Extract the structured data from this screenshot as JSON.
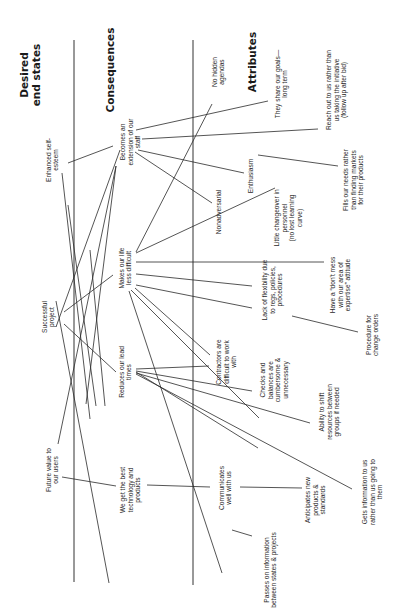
{
  "diagram": {
    "type": "hierarchical value map",
    "orientation": "rotated-90-ccw",
    "columns": [
      {
        "id": "desired",
        "lines": [
          "Desired",
          "end states"
        ],
        "x": 30,
        "y": 75
      },
      {
        "id": "consequences",
        "lines": [
          "Consequences"
        ],
        "x": 110,
        "y": 70
      },
      {
        "id": "attributes",
        "lines": [
          "Attributes"
        ],
        "x": 252,
        "y": 62
      }
    ],
    "nodes": [
      {
        "id": "self_esteem",
        "lines": [
          "Enhanced self-",
          "esteem"
        ],
        "x": 52,
        "y": 160
      },
      {
        "id": "successful_project",
        "lines": [
          "Successful",
          "project"
        ],
        "x": 48,
        "y": 317
      },
      {
        "id": "future_value",
        "lines": [
          "Future value to",
          "our users"
        ],
        "x": 52,
        "y": 470
      },
      {
        "id": "extension_staff",
        "lines": [
          "Becomes an",
          "extension of our",
          "staff"
        ],
        "x": 130,
        "y": 142
      },
      {
        "id": "life_less_difficult",
        "lines": [
          "Makes our life",
          "less difficult"
        ],
        "x": 125,
        "y": 268
      },
      {
        "id": "lead_times",
        "lines": [
          "Reduces our lead",
          "times"
        ],
        "x": 125,
        "y": 372
      },
      {
        "id": "best_technology",
        "lines": [
          "We get the best",
          "technology and",
          "products"
        ],
        "x": 130,
        "y": 490
      },
      {
        "id": "no_hidden",
        "lines": [
          "No hidden",
          "agendas"
        ],
        "x": 218,
        "y": 72
      },
      {
        "id": "nonadversarial",
        "lines": [
          "Nonadversarial"
        ],
        "x": 218,
        "y": 212
      },
      {
        "id": "contractors_difficult",
        "lines": [
          "Contractors are",
          "difficult to work",
          "with"
        ],
        "x": 226,
        "y": 362
      },
      {
        "id": "communicates",
        "lines": [
          "Communicates",
          "well with us"
        ],
        "x": 225,
        "y": 488
      },
      {
        "id": "share_goals",
        "lines": [
          "They share our goals—",
          "long term"
        ],
        "x": 281,
        "y": 84
      },
      {
        "id": "enthusiasm",
        "lines": [
          "Enthusiasm"
        ],
        "x": 250,
        "y": 176
      },
      {
        "id": "little_changeover",
        "lines": [
          "Little changeover in",
          "personnel",
          "(no lost learning",
          "curve)"
        ],
        "x": 288,
        "y": 218
      },
      {
        "id": "lack_flexibility",
        "lines": [
          "Lack of flexibility due",
          "to regs, policies,",
          "procedures"
        ],
        "x": 272,
        "y": 290
      },
      {
        "id": "checks_balances",
        "lines": [
          "Checks and",
          "balances are",
          "cumbersome &",
          "unnecessary"
        ],
        "x": 274,
        "y": 380
      },
      {
        "id": "passes_info",
        "lines": [
          "Passes on information",
          "between states & projects"
        ],
        "x": 270,
        "y": 570
      },
      {
        "id": "reach_out",
        "lines": [
          "Reach out to us rather than",
          "us taking the initiative",
          "(follow up after bid)"
        ],
        "x": 336,
        "y": 90
      },
      {
        "id": "fills_needs",
        "lines": [
          "Fills our needs rather",
          "than finding markets",
          "for their products"
        ],
        "x": 353,
        "y": 180
      },
      {
        "id": "dont_mess",
        "lines": [
          "Have a “don't mess",
          "with our area of",
          "expertise” attitude"
        ],
        "x": 340,
        "y": 285
      },
      {
        "id": "change_orders",
        "lines": [
          "Procedure for",
          "change orders"
        ],
        "x": 372,
        "y": 335
      },
      {
        "id": "shift_resources",
        "lines": [
          "Ability to shift",
          "resources between",
          "groups if needed"
        ],
        "x": 329,
        "y": 412
      },
      {
        "id": "anticipates",
        "lines": [
          "Anticipates new",
          "products &",
          "standards"
        ],
        "x": 315,
        "y": 500
      },
      {
        "id": "gets_info",
        "lines": [
          "Gets information to us",
          "rather than us going to",
          "them"
        ],
        "x": 372,
        "y": 492
      }
    ],
    "links": [
      [
        68,
        163,
        113,
        146
      ],
      [
        62,
        173,
        90,
        419
      ],
      [
        56,
        327,
        120,
        150
      ],
      [
        64,
        312,
        113,
        275
      ],
      [
        64,
        324,
        116,
        372
      ],
      [
        56,
        301,
        109,
        583
      ],
      [
        58,
        444,
        116,
        166
      ],
      [
        62,
        477,
        116,
        486
      ],
      [
        86,
        404,
        116,
        166
      ],
      [
        96,
        406,
        68,
        205
      ],
      [
        105,
        406,
        90,
        250
      ],
      [
        136,
        130,
        268,
        101
      ],
      [
        142,
        139,
        318,
        129
      ],
      [
        138,
        150,
        244,
        173
      ],
      [
        135,
        152,
        212,
        203
      ],
      [
        136,
        252,
        212,
        104
      ],
      [
        136,
        253,
        275,
        188
      ],
      [
        136,
        262,
        324,
        262
      ],
      [
        136,
        274,
        252,
        286
      ],
      [
        136,
        285,
        252,
        308
      ],
      [
        135,
        288,
        210,
        355
      ],
      [
        129,
        291,
        222,
        573
      ],
      [
        131,
        290,
        259,
        418
      ],
      [
        136,
        369,
        209,
        366
      ],
      [
        136,
        371,
        252,
        391
      ],
      [
        136,
        373,
        310,
        423
      ],
      [
        136,
        374,
        352,
        489
      ],
      [
        136,
        372,
        258,
        448
      ],
      [
        147,
        485,
        210,
        487
      ],
      [
        240,
        487,
        302,
        488
      ],
      [
        232,
        530,
        252,
        536
      ],
      [
        258,
        155,
        338,
        166
      ],
      [
        292,
        316,
        358,
        332
      ]
    ],
    "axes": {
      "left_line": {
        "x": 74,
        "y1": 40,
        "y2": 582
      },
      "right_line": {
        "x": 193,
        "y1": 40,
        "y2": 585
      }
    }
  }
}
